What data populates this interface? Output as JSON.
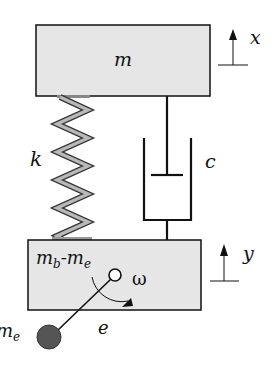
{
  "diagram": {
    "labels": {
      "top_mass": "m",
      "top_displacement": "x",
      "spring": "k",
      "damper": "c",
      "base_mass_main": "m",
      "base_mass_sub1": "b",
      "base_mass_dash": "-m",
      "base_mass_sub2": "e",
      "base_displacement": "y",
      "angular_velocity": "ω",
      "eccentricity": "e",
      "eccentric_mass_main": "m",
      "eccentric_mass_sub": "e"
    },
    "colors": {
      "mass_fill": "#e6e6e6",
      "stroke": "#111111",
      "spring_fill": "#b8b8b8",
      "eccentric_mass_fill": "#555555"
    }
  }
}
